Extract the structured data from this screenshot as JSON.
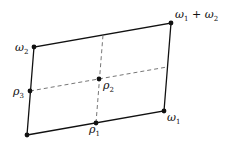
{
  "diagram": {
    "type": "fundamental-parallelogram",
    "points": {
      "origin": {
        "x": 27,
        "y": 135
      },
      "omega1": {
        "x": 164,
        "y": 111
      },
      "omega2": {
        "x": 34,
        "y": 47
      },
      "omega_sum": {
        "x": 171,
        "y": 23
      },
      "rho1": {
        "x": 96,
        "y": 123
      },
      "rho2": {
        "x": 99,
        "y": 79
      },
      "rho3": {
        "x": 30,
        "y": 91
      }
    },
    "labels": {
      "omega1": {
        "base": "ω",
        "sub": "1"
      },
      "omega2": {
        "base": "ω",
        "sub": "2"
      },
      "omega_sum": {
        "base1": "ω",
        "sub1": "1",
        "plus": " + ",
        "base2": "ω",
        "sub2": "2"
      },
      "rho1": {
        "base": "ρ",
        "sub": "1"
      },
      "rho2": {
        "base": "ρ",
        "sub": "2"
      },
      "rho3": {
        "base": "ρ",
        "sub": "3"
      }
    },
    "colors": {
      "stroke": "#111111",
      "dashed": "#666666"
    }
  }
}
